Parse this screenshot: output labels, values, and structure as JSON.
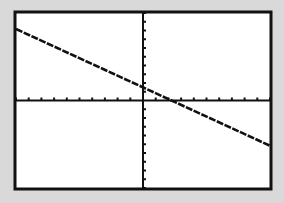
{
  "chart_data": {
    "type": "line",
    "title": "",
    "xlabel": "",
    "ylabel": "",
    "xlim": [
      -10,
      10
    ],
    "ylim": [
      -10,
      10
    ],
    "xscl": 1,
    "yscl": 1,
    "grid": false,
    "series": [
      {
        "name": "Y1",
        "equation": "y = -(2/3)x + 1.5",
        "slope": -0.6667,
        "intercept": 1.5,
        "x": [
          -10,
          10
        ],
        "y": [
          8.17,
          -5.17
        ]
      }
    ],
    "x_intercept": 2.25,
    "y_intercept": 1.5
  },
  "colors": {
    "background": "#d9d9d9",
    "screen": "#ffffff",
    "ink": "#111111"
  }
}
